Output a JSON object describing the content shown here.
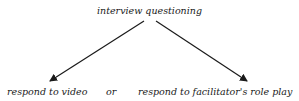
{
  "diagram": {
    "top_node": "interview questioning",
    "left_node": "respond to video",
    "connector": "or",
    "right_node": "respond to facilitator's role play",
    "arrow_color": "#1a1a1a"
  }
}
